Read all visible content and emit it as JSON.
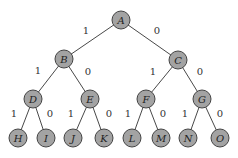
{
  "tree": {
    "nodes": [
      {
        "id": "A",
        "x": 121,
        "y": 20
      },
      {
        "id": "B",
        "x": 64,
        "y": 59
      },
      {
        "id": "C",
        "x": 178,
        "y": 60
      },
      {
        "id": "D",
        "x": 33,
        "y": 99
      },
      {
        "id": "E",
        "x": 90,
        "y": 99
      },
      {
        "id": "F",
        "x": 146,
        "y": 99
      },
      {
        "id": "G",
        "x": 202,
        "y": 99
      },
      {
        "id": "H",
        "x": 18,
        "y": 138
      },
      {
        "id": "I",
        "x": 46,
        "y": 138
      },
      {
        "id": "J",
        "x": 73,
        "y": 138
      },
      {
        "id": "K",
        "x": 104,
        "y": 138
      },
      {
        "id": "L",
        "x": 132,
        "y": 138
      },
      {
        "id": "M",
        "x": 161,
        "y": 138
      },
      {
        "id": "N",
        "x": 188,
        "y": 138
      },
      {
        "id": "O",
        "x": 220,
        "y": 138
      }
    ],
    "edges": [
      {
        "from": "A",
        "to": "B",
        "label": "1",
        "lx": 86,
        "ly": 30
      },
      {
        "from": "A",
        "to": "C",
        "label": "0",
        "lx": 157,
        "ly": 30
      },
      {
        "from": "B",
        "to": "D",
        "label": "1",
        "lx": 38,
        "ly": 70
      },
      {
        "from": "B",
        "to": "E",
        "label": "0",
        "lx": 88,
        "ly": 71
      },
      {
        "from": "C",
        "to": "F",
        "label": "1",
        "lx": 153,
        "ly": 71
      },
      {
        "from": "C",
        "to": "G",
        "label": "0",
        "lx": 200,
        "ly": 71
      },
      {
        "from": "D",
        "to": "H",
        "label": "1",
        "lx": 14,
        "ly": 113
      },
      {
        "from": "D",
        "to": "I",
        "label": "0",
        "lx": 50,
        "ly": 113
      },
      {
        "from": "E",
        "to": "J",
        "label": "1",
        "lx": 71,
        "ly": 113
      },
      {
        "from": "E",
        "to": "K",
        "label": "0",
        "lx": 109,
        "ly": 113
      },
      {
        "from": "F",
        "to": "L",
        "label": "1",
        "lx": 128,
        "ly": 113
      },
      {
        "from": "F",
        "to": "M",
        "label": "0",
        "lx": 163,
        "ly": 113
      },
      {
        "from": "G",
        "to": "N",
        "label": "1",
        "lx": 185,
        "ly": 113
      },
      {
        "from": "G",
        "to": "O",
        "label": "0",
        "lx": 220,
        "ly": 113
      }
    ],
    "node_radius": 9,
    "node_fill": "#a3a3a3",
    "node_stroke": "#444444"
  }
}
